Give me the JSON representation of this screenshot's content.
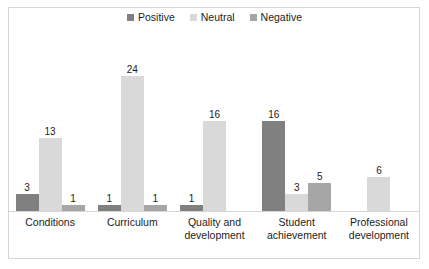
{
  "chart_data": {
    "type": "bar",
    "title": "",
    "subtitle": "",
    "xlabel": "",
    "ylabel": "",
    "grid": false,
    "legend_position": "top-center",
    "ylim": [
      0,
      24
    ],
    "categories": [
      "Conditions",
      "Curriculum",
      "Quality and development",
      "Student achievement",
      "Professional development"
    ],
    "series": [
      {
        "name": "Positive",
        "color": "#808080",
        "values": [
          3,
          1,
          1,
          16,
          null
        ]
      },
      {
        "name": "Neutral",
        "color": "#d9d9d9",
        "values": [
          13,
          24,
          16,
          3,
          6
        ]
      },
      {
        "name": "Negative",
        "color": "#a6a6a6",
        "values": [
          1,
          1,
          null,
          5,
          null
        ]
      }
    ],
    "data_labels": {
      "Conditions": {
        "Positive": "3",
        "Neutral": "13",
        "Negative": "1"
      },
      "Curriculum": {
        "Positive": "1",
        "Neutral": "24",
        "Negative": "1"
      },
      "Quality and development": {
        "Positive": "1",
        "Neutral": "16",
        "Negative": ""
      },
      "Student achievement": {
        "Positive": "16",
        "Neutral": "3",
        "Negative": "5"
      },
      "Professional development": {
        "Positive": "",
        "Neutral": "6",
        "Negative": ""
      }
    }
  },
  "legend": {
    "items": [
      {
        "label": "Positive",
        "color": "#808080"
      },
      {
        "label": "Neutral",
        "color": "#d9d9d9"
      },
      {
        "label": "Negative",
        "color": "#a6a6a6"
      }
    ]
  }
}
